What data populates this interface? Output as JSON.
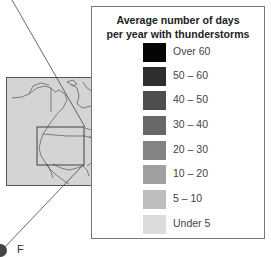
{
  "legend": {
    "title_line1": "Average number of days",
    "title_line2": "per year with thunderstorms",
    "items": [
      {
        "label": "Over 60",
        "color": "#050505"
      },
      {
        "label": "50 – 60",
        "color": "#2e2e2e"
      },
      {
        "label": "40 – 50",
        "color": "#4e4e4e"
      },
      {
        "label": "30 – 40",
        "color": "#686868"
      },
      {
        "label": "20 – 30",
        "color": "#838383"
      },
      {
        "label": "10 – 20",
        "color": "#a0a0a0"
      },
      {
        "label": "5 – 10",
        "color": "#bebebe"
      },
      {
        "label": "Under 5",
        "color": "#dcdcdc"
      }
    ]
  },
  "map": {
    "region": "North America",
    "inset": "Continental United States",
    "background_color": "#d4d4d4"
  },
  "footer": {
    "text": "F"
  }
}
